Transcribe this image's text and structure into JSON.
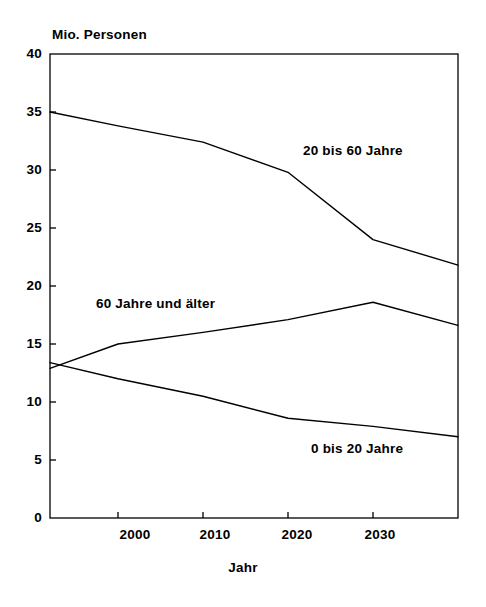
{
  "chart_data": {
    "type": "line",
    "title": "",
    "subtitle": "",
    "xlabel": "Jahr",
    "ylabel": "Mio. Personen",
    "ylabel_position": "above-axis-top-left",
    "grid": false,
    "legend": "inline-annotations",
    "xlim": [
      1992,
      2040
    ],
    "ylim": [
      0,
      40
    ],
    "ytick_labels": [
      "40",
      "35",
      "30",
      "25",
      "20",
      "15",
      "10",
      "5",
      "0"
    ],
    "ytick_values": [
      40,
      35,
      30,
      25,
      20,
      15,
      10,
      5,
      0
    ],
    "xtick_labels": [
      "2000",
      "2010",
      "2020",
      "2030"
    ],
    "xtick_values": [
      2000,
      2010,
      2020,
      2030
    ],
    "x": [
      1992,
      2000,
      2010,
      2020,
      2030,
      2040
    ],
    "series": [
      {
        "name": "20 bis 60 Jahre",
        "label": "20 bis 60 Jahre",
        "values": [
          35.0,
          33.8,
          32.4,
          29.8,
          24.0,
          21.8
        ],
        "color": "#000000"
      },
      {
        "name": "60 Jahre und älter",
        "label": "60 Jahre und älter",
        "values": [
          12.9,
          15.0,
          16.0,
          17.1,
          18.6,
          16.6
        ],
        "color": "#000000"
      },
      {
        "name": "0 bis 20 Jahre",
        "label": "0 bis 20 Jahre",
        "values": [
          13.4,
          12.0,
          10.5,
          8.6,
          7.9,
          7.0
        ],
        "color": "#000000"
      }
    ],
    "annotations": [
      {
        "text": "20 bis 60 Jahre",
        "x": 2022,
        "y": 31.5
      },
      {
        "text": "60 Jahre und älter",
        "x": 2001,
        "y": 19.8
      },
      {
        "text": "0 bis 20 Jahre",
        "x": 2024,
        "y": 5.9
      }
    ],
    "axis_color": "#000000",
    "background_color": "#ffffff"
  },
  "axes": {
    "y_title": "Mio. Personen",
    "x_title": "Jahr",
    "yticks": [
      "40",
      "35",
      "30",
      "25",
      "20",
      "15",
      "10",
      "5",
      "0"
    ],
    "xticks": [
      "2000",
      "2010",
      "2020",
      "2030"
    ]
  },
  "series_labels": {
    "middle_age": "20 bis 60 Jahre",
    "older": "60 Jahre und älter",
    "younger": "0 bis 20 Jahre"
  }
}
